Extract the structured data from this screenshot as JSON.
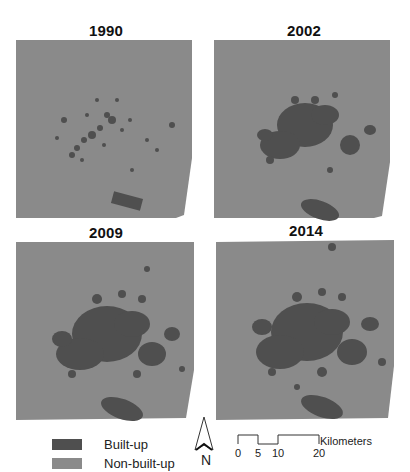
{
  "figure": {
    "panels": [
      {
        "title": "1990"
      },
      {
        "title": "2002"
      },
      {
        "title": "2009"
      },
      {
        "title": "2014"
      }
    ],
    "legend": {
      "items": [
        {
          "label": "Built-up",
          "color": "#4f4f4f"
        },
        {
          "label": "Non-built-up",
          "color": "#8a8a8a"
        }
      ]
    },
    "north_arrow": {
      "label": "N"
    },
    "scale_bar": {
      "ticks": [
        "0",
        "5",
        "10",
        "20"
      ],
      "unit": "Kilometers"
    },
    "colors": {
      "built_up": "#4f4f4f",
      "non_built_up": "#8a8a8a",
      "background": "#ffffff"
    }
  }
}
